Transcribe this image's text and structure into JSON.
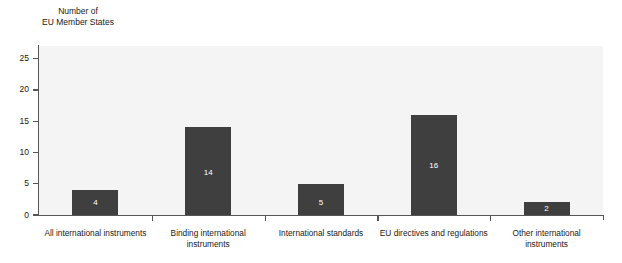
{
  "chart_data": {
    "type": "bar",
    "title": "",
    "subtitle": "",
    "ylabel": "Number of\nEU Member States",
    "xlabel": "",
    "categories": [
      "All international instruments",
      "Binding international\ninstruments",
      "International standards",
      "EU directives and regulations",
      "Other international instruments"
    ],
    "values": [
      4,
      14,
      5,
      16,
      2
    ],
    "value_labels": [
      "4",
      "14",
      "5",
      "16",
      "2"
    ],
    "ylim": [
      0,
      27
    ],
    "yticks": [
      0,
      5,
      10,
      15,
      20,
      25
    ],
    "ytick_labels": [
      "0",
      "5",
      "10",
      "15",
      "20",
      "25"
    ],
    "grid": false,
    "legend": false,
    "bar_color": "#3f3f3f",
    "value_label_color": "#ffffff",
    "plot_background": "#f4f4f4",
    "axis_color": "#555555",
    "figure_background": "#ffffff"
  }
}
